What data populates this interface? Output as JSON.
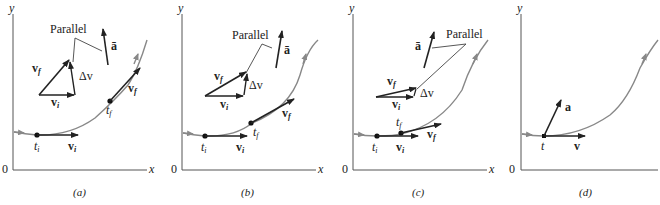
{
  "figure": {
    "colors": {
      "axis": "#555555",
      "path": "#888888",
      "vector": "#222222",
      "leader": "#444444",
      "point": "#111111"
    },
    "axis_labels": {
      "y": "y",
      "x": "x",
      "origin": "0"
    },
    "panels": [
      {
        "caption": "(a)",
        "parallel_label": "Parallel",
        "avg_accel_label": "ā",
        "delta_v_label": "Δv",
        "vf_label": "v",
        "vf_sub": "f",
        "vi_label": "v",
        "vi_sub": "i",
        "ti_label": "t",
        "ti_sub": "i",
        "tf_label": "t",
        "tf_sub": "f"
      },
      {
        "caption": "(b)",
        "parallel_label": "Parallel",
        "avg_accel_label": "ā",
        "delta_v_label": "Δv",
        "vf_label": "v",
        "vf_sub": "f",
        "vi_label": "v",
        "vi_sub": "i",
        "ti_label": "t",
        "ti_sub": "i",
        "tf_label": "t",
        "tf_sub": "f"
      },
      {
        "caption": "(c)",
        "parallel_label": "Parallel",
        "avg_accel_label": "ā",
        "delta_v_label": "Δv",
        "vf_label": "v",
        "vf_sub": "f",
        "vi_label": "v",
        "vi_sub": "i",
        "ti_label": "t",
        "ti_sub": "i",
        "tf_label": "t",
        "tf_sub": "f"
      },
      {
        "caption": "(d)",
        "a_label": "a",
        "v_label": "v",
        "t_label": "t"
      }
    ]
  }
}
